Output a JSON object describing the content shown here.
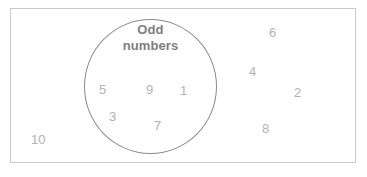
{
  "diagram": {
    "type": "venn-single-set",
    "universal_set": {
      "name": "universal-set-rectangle",
      "border_color": "#c9c9c9",
      "fill_color": "#ffffff"
    },
    "circle": {
      "name": "odd-numbers-circle",
      "border_color": "#8a8a8a",
      "label_line_1": "Odd",
      "label_line_2": "numbers",
      "label_color": "#7e7e7e"
    },
    "number_color": "#b2b2b2",
    "members_inside_circle": [
      {
        "value": "5",
        "x": 99,
        "y": 83
      },
      {
        "value": "9",
        "x": 146,
        "y": 83
      },
      {
        "value": "1",
        "x": 180,
        "y": 84
      },
      {
        "value": "3",
        "x": 109,
        "y": 110
      },
      {
        "value": "7",
        "x": 154,
        "y": 119
      }
    ],
    "members_outside_circle": [
      {
        "value": "6",
        "x": 269,
        "y": 26
      },
      {
        "value": "4",
        "x": 249,
        "y": 65
      },
      {
        "value": "2",
        "x": 294,
        "y": 86
      },
      {
        "value": "8",
        "x": 262,
        "y": 122
      },
      {
        "value": "10",
        "x": 31,
        "y": 133
      }
    ]
  }
}
